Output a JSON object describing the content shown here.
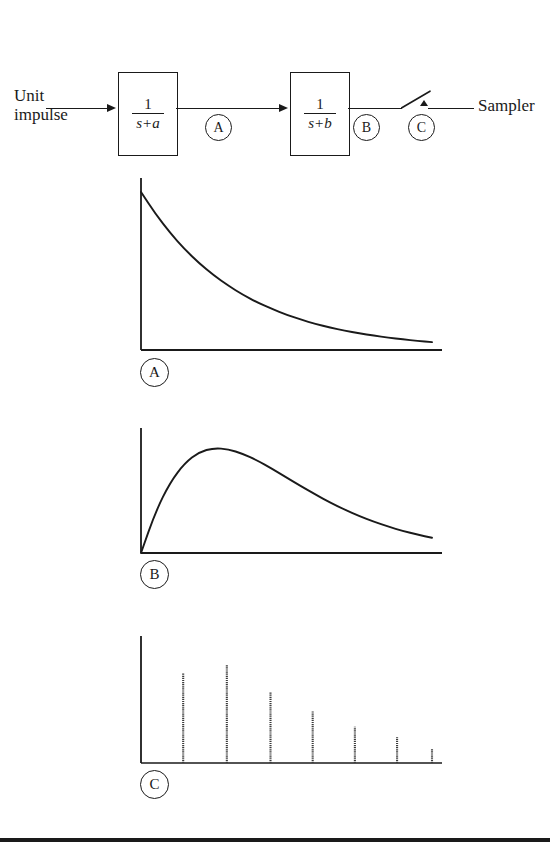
{
  "figure": {
    "type": "control-system-block-diagram-with-response-plots",
    "bottom_rule": true
  },
  "block_diagram": {
    "input_label": "Unit\nimpulse",
    "input_label_line1": "Unit",
    "input_label_line2": "impulse",
    "sampler_label": "Sampler",
    "blocks": [
      {
        "id": "tf-a",
        "numerator": "1",
        "denominator": "s+a"
      },
      {
        "id": "tf-b",
        "numerator": "1",
        "denominator": "s+b"
      }
    ],
    "nodes": [
      {
        "id": "node-a",
        "label": "A"
      },
      {
        "id": "node-b",
        "label": "B"
      },
      {
        "id": "node-c",
        "label": "C"
      }
    ],
    "switch": {
      "name": "sampler-switch",
      "state": "open"
    }
  },
  "plots": [
    {
      "id": "plot-a",
      "tag": "A",
      "description": "decaying exponential impulse response of 1/(s+a)"
    },
    {
      "id": "plot-b",
      "tag": "B",
      "description": "difference of exponentials, rises to peak then decays"
    },
    {
      "id": "plot-c",
      "tag": "C",
      "description": "sampled version of signal B, impulse train"
    }
  ],
  "chart_data": [
    {
      "id": "plot-a",
      "type": "line",
      "title": "",
      "xlabel": "",
      "ylabel": "",
      "grid": false,
      "legend": null,
      "xlim": [
        0,
        1
      ],
      "ylim": [
        0,
        1
      ],
      "curve": "exponential-decay",
      "x": [
        0.0,
        0.05,
        0.1,
        0.15,
        0.2,
        0.25,
        0.3,
        0.35,
        0.4,
        0.45,
        0.5,
        0.55,
        0.6,
        0.65,
        0.7,
        0.75,
        0.8,
        0.85,
        0.9,
        0.95,
        1.0
      ],
      "y": [
        1.0,
        0.861,
        0.741,
        0.638,
        0.549,
        0.472,
        0.407,
        0.35,
        0.301,
        0.26,
        0.223,
        0.192,
        0.165,
        0.142,
        0.123,
        0.105,
        0.091,
        0.078,
        0.067,
        0.058,
        0.05
      ]
    },
    {
      "id": "plot-b",
      "type": "line",
      "title": "",
      "xlabel": "",
      "ylabel": "",
      "grid": false,
      "legend": null,
      "xlim": [
        0,
        1
      ],
      "ylim": [
        0,
        1
      ],
      "curve": "difference-of-exponentials",
      "peak_x": 0.25,
      "peak_y": 1.0,
      "x": [
        0.0,
        0.05,
        0.1,
        0.15,
        0.2,
        0.25,
        0.3,
        0.35,
        0.4,
        0.45,
        0.5,
        0.55,
        0.6,
        0.65,
        0.7,
        0.75,
        0.8,
        0.85,
        0.9,
        0.95,
        1.0
      ],
      "y": [
        0.0,
        0.392,
        0.672,
        0.855,
        0.962,
        1.0,
        0.989,
        0.945,
        0.88,
        0.802,
        0.719,
        0.636,
        0.556,
        0.481,
        0.413,
        0.352,
        0.298,
        0.251,
        0.21,
        0.175,
        0.145
      ]
    },
    {
      "id": "plot-c",
      "type": "bar",
      "title": "",
      "xlabel": "",
      "ylabel": "",
      "grid": false,
      "legend": null,
      "xlim": [
        0,
        1
      ],
      "ylim": [
        0,
        1
      ],
      "curve": "sampled-impulse-train",
      "sample_count": 7,
      "categories": [
        "1",
        "2",
        "3",
        "4",
        "5",
        "6",
        "7"
      ],
      "x": [
        0.145,
        0.295,
        0.445,
        0.59,
        0.735,
        0.88,
        1.0
      ],
      "values": [
        0.74,
        0.81,
        0.585,
        0.43,
        0.3,
        0.215,
        0.12
      ]
    }
  ]
}
